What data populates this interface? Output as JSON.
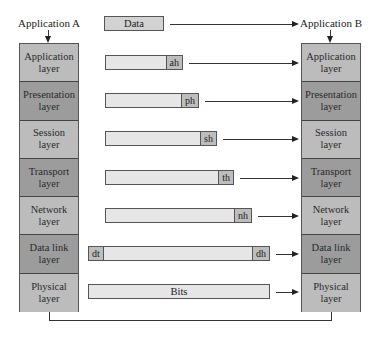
{
  "diagram": {
    "sender": {
      "label": "Application A"
    },
    "receiver": {
      "label": "Application B"
    },
    "data_unit": {
      "label": "Data"
    },
    "layers": [
      {
        "name": "Application",
        "suffix": "layer",
        "color": "#bcbcbc",
        "header": "ah"
      },
      {
        "name": "Presentation",
        "suffix": "layer",
        "color": "#9c9c9c",
        "header": "ph"
      },
      {
        "name": "Session",
        "suffix": "layer",
        "color": "#bcbcbc",
        "header": "sh"
      },
      {
        "name": "Transport",
        "suffix": "layer",
        "color": "#9c9c9c",
        "header": "th"
      },
      {
        "name": "Network",
        "suffix": "layer",
        "color": "#bcbcbc",
        "header": "nh"
      },
      {
        "name": "Data link",
        "suffix": "layer",
        "color": "#9c9c9c",
        "header": "dh",
        "trailer": "dt"
      },
      {
        "name": "Physical",
        "suffix": "layer",
        "color": "#bcbcbc",
        "payload": "Bits"
      }
    ],
    "colors": {
      "packet_fill": "#e6e6e6",
      "header_fill": "#bdbdbd",
      "line": "#333333"
    }
  }
}
